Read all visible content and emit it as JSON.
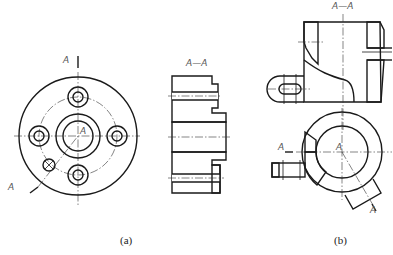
{
  "figure_a": {
    "front_view_labels": {
      "top": "A",
      "center": "A",
      "bottom_left": "A"
    },
    "section_title": "A—A",
    "caption": "(a)"
  },
  "figure_b": {
    "section_title": "A—A",
    "bottom_view_labels": {
      "left": "A",
      "center": "A",
      "bottom_right": "A"
    },
    "caption": "(b)"
  }
}
